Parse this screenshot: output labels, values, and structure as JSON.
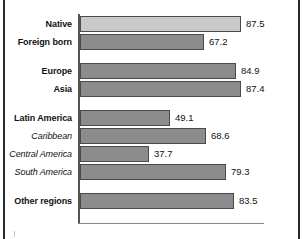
{
  "chart_data": {
    "type": "bar",
    "orientation": "horizontal",
    "title": "",
    "subtitle": "",
    "xlabel": "",
    "ylabel": "",
    "xlim": [
      0,
      100
    ],
    "grid": false,
    "legend": false,
    "categories": [
      "Native",
      "Foreign born",
      "Europe",
      "Asia",
      "Latin America",
      "Caribbean",
      "Central America",
      "South America",
      "Other regions"
    ],
    "values": [
      87.5,
      67.2,
      84.9,
      87.4,
      49.1,
      68.6,
      37.7,
      79.3,
      83.5
    ],
    "value_labels": [
      "87.5",
      "67.2",
      "84.9",
      "87.4",
      "49.1",
      "68.6",
      "37.7",
      "79.3",
      "83.5"
    ],
    "bars": [
      {
        "label": "Native",
        "value": 87.5,
        "value_label": "87.5",
        "style": "bold",
        "color": "#c9c9c9",
        "group_gap_before": false
      },
      {
        "label": "Foreign born",
        "value": 67.2,
        "value_label": "67.2",
        "style": "bold",
        "color": "#8c8c8c",
        "group_gap_before": false
      },
      {
        "label": "Europe",
        "value": 84.9,
        "value_label": "84.9",
        "style": "bold",
        "color": "#8c8c8c",
        "group_gap_before": true
      },
      {
        "label": "Asia",
        "value": 87.4,
        "value_label": "87.4",
        "style": "bold",
        "color": "#8c8c8c",
        "group_gap_before": false
      },
      {
        "label": "Latin America",
        "value": 49.1,
        "value_label": "49.1",
        "style": "bold",
        "color": "#8c8c8c",
        "group_gap_before": true
      },
      {
        "label": "Caribbean",
        "value": 68.6,
        "value_label": "68.6",
        "style": "italic",
        "color": "#8c8c8c",
        "group_gap_before": false
      },
      {
        "label": "Central America",
        "value": 37.7,
        "value_label": "37.7",
        "style": "italic",
        "color": "#8c8c8c",
        "group_gap_before": false
      },
      {
        "label": "South America",
        "value": 79.3,
        "value_label": "79.3",
        "style": "italic",
        "color": "#8c8c8c",
        "group_gap_before": false
      },
      {
        "label": "Other regions",
        "value": 83.5,
        "value_label": "83.5",
        "style": "bold",
        "color": "#8c8c8c",
        "group_gap_before": true
      }
    ],
    "colors": {
      "bar_default": "#8c8c8c",
      "bar_highlight": "#c9c9c9",
      "bar_outline": "#4a4a4a",
      "axis": "#555555",
      "frame": "#2b2b2b",
      "text": "#111111"
    }
  }
}
